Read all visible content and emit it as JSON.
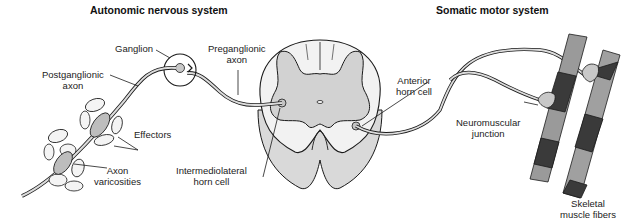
{
  "titles": {
    "autonomic": "Autonomic nervous system",
    "somatic": "Somatic motor system"
  },
  "labels": {
    "ganglion": "Ganglion",
    "preganglionic_1": "Preganglionic",
    "preganglionic_2": "axon",
    "postganglionic_1": "Postganglionic",
    "postganglionic_2": "axon",
    "effectors": "Effectors",
    "axon_varicosities_1": "Axon",
    "axon_varicosities_2": "varicosities",
    "intermediolateral_1": "Intermediolateral",
    "intermediolateral_2": "horn cell",
    "anterior_horn_1": "Anterior",
    "anterior_horn_2": "horn cell",
    "neuromuscular_1": "Neuromuscular",
    "neuromuscular_2": "junction",
    "skeletal_1": "Skeletal",
    "skeletal_2": "muscle fibers"
  },
  "colors": {
    "outline": "#1a1a1a",
    "gray_matter": "#d4d4d4",
    "white_matter": "#efefef",
    "muscle_light": "#9a9a9a",
    "muscle_dark": "#3a3a3a",
    "axon_fill": "#cfcfcf"
  }
}
